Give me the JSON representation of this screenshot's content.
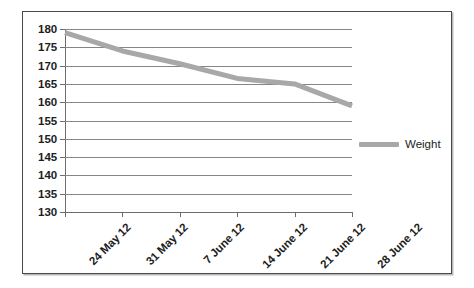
{
  "chart_data": {
    "type": "line",
    "title": "",
    "xlabel": "",
    "ylabel": "",
    "categories": [
      "24 May 12",
      "31 May 12",
      "7 June 12",
      "14 June 12",
      "21 June 12",
      "28 June 12"
    ],
    "series": [
      {
        "name": "Weight",
        "values": [
          179,
          174,
          170.5,
          166.5,
          165,
          159
        ],
        "color": "#a8a8a8"
      }
    ],
    "ylim": [
      130,
      180
    ],
    "ytick_step": 5,
    "ytick_labels": [
      "180",
      "175",
      "170",
      "165",
      "160",
      "155",
      "150",
      "145",
      "140",
      "135",
      "130"
    ],
    "grid": true,
    "legend_position": "right"
  },
  "legend": {
    "entries": [
      {
        "label": "Weight",
        "color": "#a8a8a8"
      }
    ]
  },
  "colors": {
    "series": "#a8a8a8",
    "gridline": "#868686",
    "axis": "#6d6d6d",
    "border": "#4a4a4a",
    "text": "#1d1d1d"
  }
}
